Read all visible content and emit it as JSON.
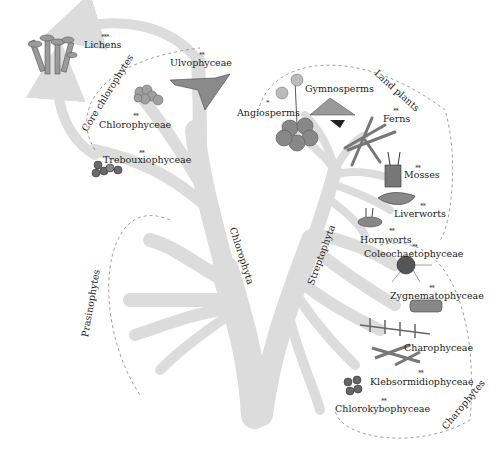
{
  "diagram": {
    "type": "phylogenetic tree of green plants (Viridiplantae)",
    "branch_color": "#dcdcdc",
    "organism_color": "#8a8a8a",
    "dark_color": "#4a4a4a",
    "lineages": {
      "chlorophyta": "Chlorophyta",
      "streptophyta": "Streptophyta"
    },
    "groups": {
      "core_chlorophytes": "Core chlorophytes",
      "prasinophytes": "Prasinophytes",
      "land_plants": "Land plants",
      "charophytes": "Charophytes"
    },
    "taxa": [
      {
        "id": "lichens",
        "label": "Lichens",
        "stars": "***"
      },
      {
        "id": "ulvophyceae",
        "label": "Ulvophyceae",
        "stars": "**"
      },
      {
        "id": "chlorophyceae",
        "label": "Chlorophyceae",
        "stars": "**"
      },
      {
        "id": "trebouxiophyceae",
        "label": "Trebouxiophyceae",
        "stars": "**"
      },
      {
        "id": "angiosperms",
        "label": "Angiosperms",
        "stars": "*"
      },
      {
        "id": "gymnosperms",
        "label": "Gymnosperms",
        "stars": ""
      },
      {
        "id": "ferns",
        "label": "Ferns",
        "stars": "**"
      },
      {
        "id": "mosses",
        "label": "Mosses",
        "stars": "**"
      },
      {
        "id": "liverworts",
        "label": "Liverworts",
        "stars": "**"
      },
      {
        "id": "hornworts",
        "label": "Hornworts",
        "stars": "**"
      },
      {
        "id": "coleochaetophyceae",
        "label": "Coleochaetophyceae",
        "stars": "**"
      },
      {
        "id": "zygnematophyceae",
        "label": "Zygnematophyceae",
        "stars": "**"
      },
      {
        "id": "charophyceae",
        "label": "Charophyceae",
        "stars": ""
      },
      {
        "id": "klebsormidiophyceae",
        "label": "Klebsormidiophyceae",
        "stars": "**"
      },
      {
        "id": "chlorokybophyceae",
        "label": "Chlorokybophyceae",
        "stars": "**"
      }
    ]
  }
}
